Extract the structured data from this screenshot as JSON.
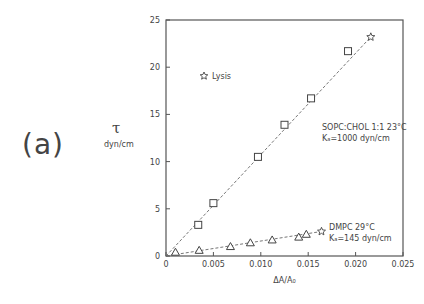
{
  "panel_label": "(a)",
  "y_symbol": "τ",
  "y_unit": "dyn/cm",
  "x_label": "ΔA/A₀",
  "legend": {
    "symbol": "☆",
    "label": "Lysis"
  },
  "annotations": {
    "sopc_line1": "SOPC:CHOL 1:1 23°C",
    "sopc_line2": "Kₐ=1000 dyn/cm",
    "dmpc_line1": "DMPC 29°C",
    "dmpc_line2": "Kₐ=145 dyn/cm"
  },
  "chart_data": {
    "type": "scatter",
    "title": "",
    "xlabel": "ΔA/A₀",
    "ylabel": "τ (dyn/cm)",
    "xlim": [
      0,
      0.025
    ],
    "ylim": [
      0,
      25
    ],
    "x_ticks": [
      "0",
      "0.005",
      "0.010",
      "0.015",
      "0.020",
      "0.025"
    ],
    "y_ticks": [
      "0",
      "5",
      "10",
      "15",
      "20",
      "25"
    ],
    "grid": false,
    "series": [
      {
        "name": "SOPC:CHOL 1:1 23°C",
        "marker": "square",
        "fit_line": "dashed",
        "K_a": "1000 dyn/cm",
        "x": [
          0.0034,
          0.005,
          0.0097,
          0.0125,
          0.0153,
          0.0192
        ],
        "y": [
          3.3,
          5.6,
          10.5,
          13.9,
          16.7,
          21.7
        ],
        "lysis_point": {
          "x": 0.0216,
          "y": 23.2
        }
      },
      {
        "name": "DMPC 29°C",
        "marker": "triangle",
        "fit_line": "dashed",
        "K_a": "145 dyn/cm",
        "x": [
          0.001,
          0.0035,
          0.0068,
          0.0089,
          0.0112,
          0.014,
          0.0148
        ],
        "y": [
          0.4,
          0.6,
          1.0,
          1.4,
          1.7,
          2.0,
          2.3
        ],
        "lysis_point": {
          "x": 0.0164,
          "y": 2.6
        }
      }
    ]
  }
}
